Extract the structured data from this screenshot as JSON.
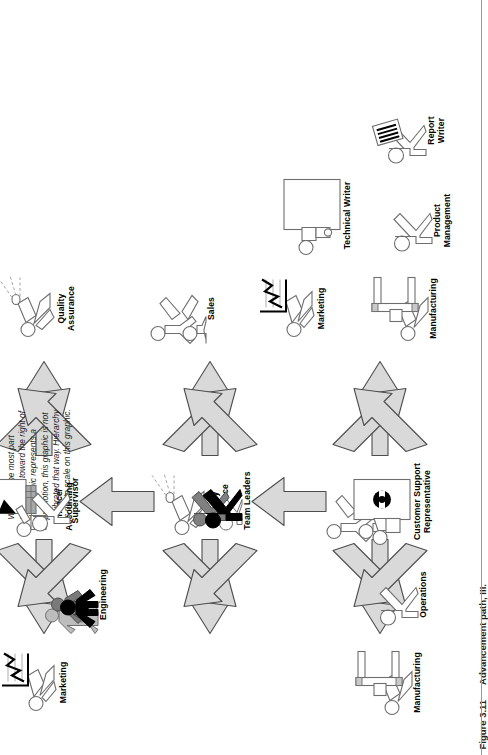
{
  "note": {
    "text": "While for the most part movement toward the right of the graphic represents a promotion, this graphic is not calibrated that way. Hierarchy is not to scale on this graphic."
  },
  "caption": {
    "figure_number": "Figure 3.11",
    "figure_title": "Advancement path, III."
  },
  "nodes": [
    {
      "id": "marketing-top",
      "label": "Marketing",
      "icon": "person-presenting-chart-icon"
    },
    {
      "id": "engineering",
      "label": "Engineering",
      "icon": "group-of-people-icon"
    },
    {
      "id": "finance-accounting",
      "label": "Finance/\nAccounting",
      "icon": "person-at-desk-icon"
    },
    {
      "id": "quality-assurance-1",
      "label": "Quality\nAssurance",
      "icon": "person-inspecting-icon"
    },
    {
      "id": "sales-left",
      "label": "Sales",
      "icon": "two-people-icon"
    },
    {
      "id": "operations",
      "label": "Operations",
      "icon": "person-icon"
    },
    {
      "id": "manufacturing-left",
      "label": "Manufacturing",
      "icon": "person-at-machine-icon"
    },
    {
      "id": "supervisor",
      "label": "Supervisor",
      "icon": "person-icon"
    },
    {
      "id": "team-leaders",
      "label": "Team Leaders",
      "icon": "group-of-people-icon"
    },
    {
      "id": "customer-support",
      "label": "Customer Support\nRepresentative",
      "icon": "person-with-headset-at-desk-icon"
    },
    {
      "id": "quality-assurance-2",
      "label": "Quality\nAssurance",
      "icon": "person-inspecting-icon"
    },
    {
      "id": "sales-right",
      "label": "Sales",
      "icon": "two-people-icon"
    },
    {
      "id": "marketing-right",
      "label": "Marketing",
      "icon": "person-presenting-chart-icon"
    },
    {
      "id": "manufacturing-right",
      "label": "Manufacturing",
      "icon": "person-at-machine-icon"
    },
    {
      "id": "technical-writer",
      "label": "Technical Writer",
      "icon": "person-at-computer-desk-icon"
    },
    {
      "id": "product-management",
      "label": "Product\nManagement",
      "icon": "person-icon"
    },
    {
      "id": "report-writer",
      "label": "Report\nWriter",
      "icon": "person-with-document-icon"
    }
  ],
  "arrows": [
    {
      "id": "arrow-csr-fan-left",
      "kind": "three-way-left",
      "name": "arrow-three-way-left"
    },
    {
      "id": "arrow-csr-fan-right",
      "kind": "three-way-right",
      "name": "arrow-three-way-right"
    },
    {
      "id": "arrow-csr-up",
      "kind": "up",
      "name": "arrow-up"
    },
    {
      "id": "arrow-team-fan-left",
      "kind": "three-way-left",
      "name": "arrow-three-way-left"
    },
    {
      "id": "arrow-team-fan-right",
      "kind": "three-way-right",
      "name": "arrow-three-way-right"
    },
    {
      "id": "arrow-team-up",
      "kind": "up",
      "name": "arrow-up"
    },
    {
      "id": "arrow-sup-fan-left",
      "kind": "three-way-left",
      "name": "arrow-three-way-left"
    },
    {
      "id": "arrow-sup-fan-right",
      "kind": "three-way-right",
      "name": "arrow-three-way-right"
    }
  ],
  "colors": {
    "arrow_fill": "#d9d9d9",
    "arrow_stroke": "#4d4d4d",
    "figure_stroke": "#6e6e6e",
    "dark_fill": "#000000",
    "mid_gray": "#808080",
    "text": "#000000",
    "background": "#ffffff"
  }
}
